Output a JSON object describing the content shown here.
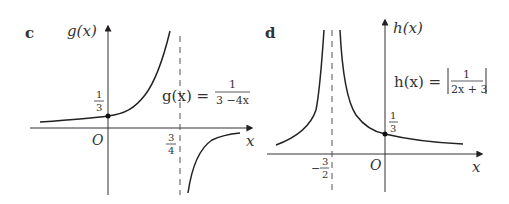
{
  "panels": [
    {
      "id": "c",
      "panel_label": "c",
      "y_axis_label": "g(x)",
      "x_axis_label": "x",
      "origin_label": "O",
      "function_lhs": "g(x) =",
      "function_num": "1",
      "function_den": "3 −4x",
      "y_intercept": {
        "num": "1",
        "den": "3"
      },
      "asymptote": {
        "num": "3",
        "den": "4"
      }
    },
    {
      "id": "d",
      "panel_label": "d",
      "y_axis_label": "h(x)",
      "x_axis_label": "x",
      "origin_label": "O",
      "function_lhs": "h(x) =",
      "function_num": "1",
      "function_den": "2x + 3",
      "y_intercept": {
        "num": "1",
        "den": "3"
      },
      "asymptote": {
        "sign": "−",
        "num": "3",
        "den": "2"
      }
    }
  ],
  "colors": {
    "curve": "#222222",
    "axis": "#333333",
    "text": "#333333"
  }
}
